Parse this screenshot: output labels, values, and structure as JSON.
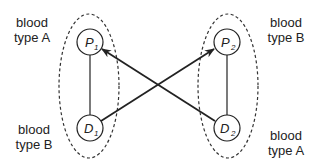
{
  "diagram": {
    "type": "kidney-exchange-pairs",
    "colors": {
      "stroke": "#222222",
      "dashed": "#333333",
      "background": "#ffffff"
    },
    "groups": [
      {
        "id": "pair-1",
        "patient": {
          "letter": "P",
          "sub": "1"
        },
        "donor": {
          "letter": "D",
          "sub": "1"
        },
        "patient_label": [
          "blood",
          "type A"
        ],
        "donor_label": [
          "blood",
          "type B"
        ]
      },
      {
        "id": "pair-2",
        "patient": {
          "letter": "P",
          "sub": "2"
        },
        "donor": {
          "letter": "D",
          "sub": "2"
        },
        "patient_label": [
          "blood",
          "type B"
        ],
        "donor_label": [
          "blood",
          "type A"
        ]
      }
    ],
    "edges": [
      {
        "from": "D1",
        "to": "P2",
        "directed": true
      },
      {
        "from": "D2",
        "to": "P1",
        "directed": true
      },
      {
        "from": "P1",
        "to": "D1",
        "directed": false
      },
      {
        "from": "P2",
        "to": "D2",
        "directed": false
      }
    ]
  }
}
